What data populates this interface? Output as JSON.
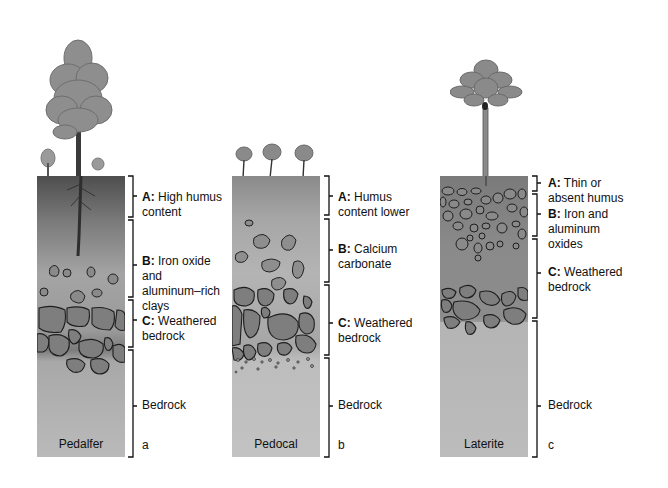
{
  "diagram": {
    "panels": [
      {
        "id": "a",
        "letter": "a",
        "soil_name": "Pedalfer",
        "horizons": [
          {
            "key": "A:",
            "text": "High humus",
            "text2": "content"
          },
          {
            "key": "B:",
            "text": "Iron oxide",
            "text2": "and",
            "text3": "aluminum–rich",
            "text4": "clays"
          },
          {
            "key": "C:",
            "text": "Weathered",
            "text2": "bedrock"
          },
          {
            "key": "",
            "text": "Bedrock"
          }
        ]
      },
      {
        "id": "b",
        "letter": "b",
        "soil_name": "Pedocal",
        "horizons": [
          {
            "key": "A:",
            "text": "Humus",
            "text2": "content lower"
          },
          {
            "key": "B:",
            "text": "Calcium",
            "text2": "carbonate"
          },
          {
            "key": "C:",
            "text": "Weathered",
            "text2": "bedrock"
          },
          {
            "key": "",
            "text": "Bedrock"
          }
        ]
      },
      {
        "id": "c",
        "letter": "c",
        "soil_name": "Laterite",
        "horizons": [
          {
            "key": "A:",
            "text": "Thin or",
            "text2": "absent humus"
          },
          {
            "key": "B:",
            "text": "Iron and",
            "text2": "aluminum",
            "text3": "oxides"
          },
          {
            "key": "C:",
            "text": "Weathered",
            "text2": "bedrock"
          },
          {
            "key": "",
            "text": "Bedrock"
          }
        ]
      }
    ],
    "colors": {
      "humus_dark": "#5a5a5a",
      "soil_mid": "#9a9a9a",
      "bedrock": "#b8b8b8",
      "rock_fill": "#8c8c8c",
      "outline": "#222222"
    }
  }
}
